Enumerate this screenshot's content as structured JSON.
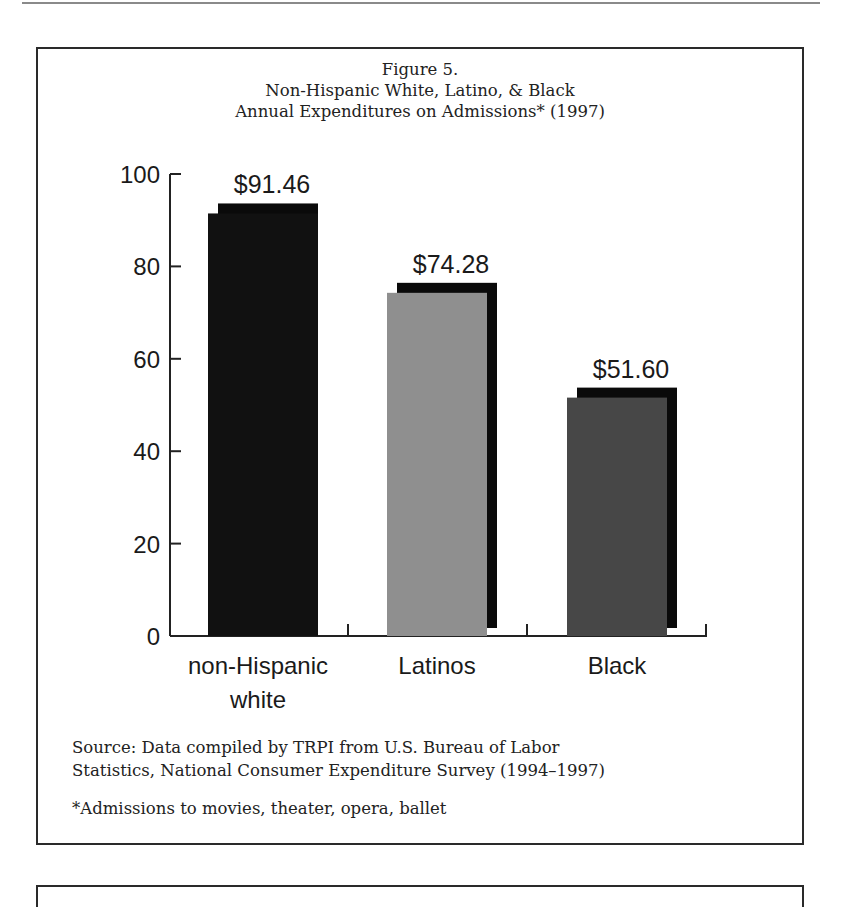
{
  "figure": {
    "number": "Figure 5.",
    "title_line1": "Non-Hispanic White, Latino, & Black",
    "title_line2": "Annual Expenditures on Admissions* (1997)",
    "source_line1": "Source: Data compiled by TRPI from U.S. Bureau of Labor",
    "source_line2": "Statistics, National Consumer Expenditure Survey (1994–1997)",
    "footnote": "*Admissions to movies, theater, opera, ballet"
  },
  "chart_data": {
    "type": "bar",
    "title": "Figure 5. Non-Hispanic White, Latino, & Black Annual Expenditures on Admissions* (1997)",
    "categories": [
      "non-Hispanic white",
      "Latinos",
      "Black"
    ],
    "category_lines": [
      [
        "non-Hispanic",
        "white"
      ],
      [
        "Latinos"
      ],
      [
        "Black"
      ]
    ],
    "values": [
      91.46,
      74.28,
      51.6
    ],
    "value_labels": [
      "$91.46",
      "$74.28",
      "$51.60"
    ],
    "bar_colors": [
      "#111111",
      "#8f8f8f",
      "#474747"
    ],
    "shadow_color": "#0a0a0a",
    "xlabel": "",
    "ylabel": "",
    "ylim": [
      0,
      100
    ],
    "yticks": [
      0,
      20,
      40,
      60,
      80,
      100
    ],
    "ytick_labels": [
      "0",
      "20",
      "40",
      "60",
      "80",
      "100"
    ],
    "grid": false,
    "legend": "none",
    "style": "3D drop-shadow bars"
  }
}
